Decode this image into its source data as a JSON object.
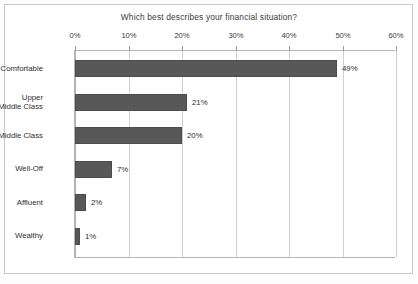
{
  "chart_data": {
    "type": "bar",
    "orientation": "horizontal",
    "title": "Which best describes your financial situation?",
    "xlabel": "",
    "ylabel": "",
    "categories": [
      "Comfortable",
      "Upper\nMiddle Class",
      "Middle Class",
      "Well-Off",
      "Affluent",
      "Wealthy"
    ],
    "values": [
      49,
      21,
      20,
      7,
      2,
      1
    ],
    "value_labels": [
      "49%",
      "21%",
      "20%",
      "7%",
      "2%",
      "1%"
    ],
    "xlim": [
      0,
      60
    ],
    "xticks": [
      0,
      10,
      20,
      30,
      40,
      50,
      60
    ],
    "xtick_labels": [
      "0%",
      "10%",
      "20%",
      "30%",
      "40%",
      "50%",
      "60%"
    ],
    "grid": true,
    "grid_axis": "x",
    "legend": false,
    "bar_color": "#585858",
    "grid_color": "#cfcfcf",
    "axis_color": "#b4b4b4",
    "text_color": "#2e2e2e"
  }
}
